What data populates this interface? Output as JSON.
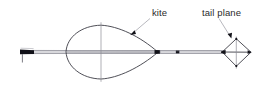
{
  "figure": {
    "background_color": "#ffffff",
    "width": 265,
    "height": 93,
    "line_color": "#3b3b44",
    "thin_line_color": "#8d8d95",
    "accent_dark": "#111118",
    "label_color": "#2b2b2b"
  },
  "labels": [
    {
      "id": "kite",
      "text": "kite",
      "x": 152,
      "y": 14,
      "leader_from": [
        150,
        18
      ],
      "leader_to": [
        132,
        33
      ],
      "arrow_at": [
        131,
        34
      ]
    },
    {
      "id": "tail-plane",
      "text": "tail plane",
      "x": 203,
      "y": 14,
      "leader_from": [
        219,
        18
      ],
      "leader_to": [
        230,
        37
      ],
      "arrow_at": [
        231,
        38
      ]
    }
  ],
  "parts": {
    "handle": {
      "name": "towing handle",
      "x": 20,
      "y": 50,
      "width": 14,
      "height": 4
    },
    "tow_rod": {
      "name": "tow rod",
      "from_x": 33,
      "to_x": 158,
      "y": 52
    },
    "kite_body": {
      "name": "kite teardrop body",
      "nose_x": 66,
      "tip_x": 158,
      "center_x": 101,
      "center_y": 52,
      "top_y": 25,
      "bottom_y": 79
    },
    "link_rod": {
      "name": "link rod",
      "from_x": 158,
      "to_x": 224,
      "y": 52
    },
    "tail_plane": {
      "name": "tail plane diamond",
      "left_x": 222,
      "right_x": 251,
      "center_x": 236,
      "center_y": 52,
      "top_y": 39,
      "bottom_y": 66
    }
  }
}
